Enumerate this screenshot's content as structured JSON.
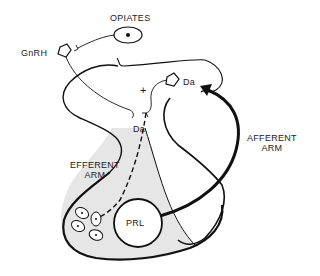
{
  "diagram": {
    "labels": {
      "opiates": "OPIATES",
      "gnrh": "GnRH",
      "plus": "+",
      "da_top": "Da",
      "da_mid": "Da",
      "efferent_line1": "EFFERENT",
      "efferent_line2": "ARM",
      "afferent_line1": "AFFERENT",
      "afferent_line2": "ARM",
      "prl": "PRL"
    },
    "colors": {
      "ink": "#111111",
      "pituitary_fill": "#e6e6e6",
      "background": "#ffffff"
    }
  }
}
